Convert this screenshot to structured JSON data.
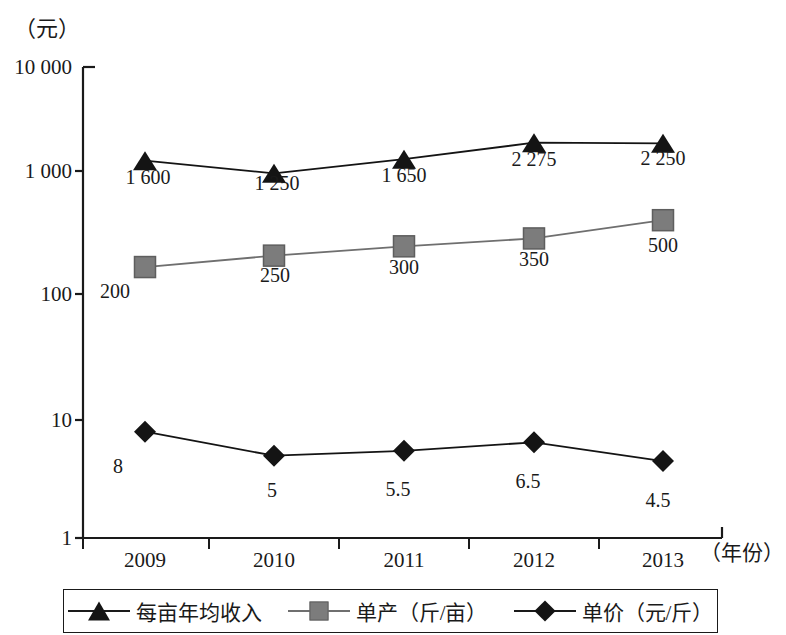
{
  "chart_data": {
    "type": "line",
    "title": "",
    "xlabel": "（年份）",
    "ylabel": "（元）",
    "yscale": "log",
    "ylim": [
      1,
      10000
    ],
    "grid": false,
    "legend_position": "bottom",
    "categories": [
      "2009",
      "2010",
      "2011",
      "2012",
      "2013"
    ],
    "y_ticks": [
      "10 000",
      "1 000",
      "100",
      "10",
      "1"
    ],
    "y_tick_values": [
      10000,
      1000,
      100,
      10,
      1
    ],
    "series": [
      {
        "name": "每亩年均收入",
        "marker": "triangle",
        "color": "#141414",
        "values": [
          1600,
          1250,
          1650,
          2275,
          2250
        ],
        "labels": [
          "1 600",
          "1 250",
          "1 650",
          "2 275",
          "2 250"
        ]
      },
      {
        "name": "单产（斤/亩）",
        "marker": "square",
        "color": "#7c7c7c",
        "values": [
          200,
          250,
          300,
          350,
          500
        ],
        "labels": [
          "200",
          "250",
          "300",
          "350",
          "500"
        ]
      },
      {
        "name": "单价（元/斤）",
        "marker": "diamond",
        "color": "#141414",
        "values": [
          8,
          5,
          5.5,
          6.5,
          4.5
        ],
        "labels": [
          "8",
          "5",
          "5.5",
          "6.5",
          "4.5"
        ]
      }
    ]
  },
  "axes": {
    "y_unit": "（元）",
    "x_unit": "（年份）",
    "y_ticks": [
      {
        "label": "10 000"
      },
      {
        "label": "1 000"
      },
      {
        "label": "100"
      },
      {
        "label": "10"
      },
      {
        "label": "1"
      }
    ],
    "x_ticks": [
      {
        "label": "2009"
      },
      {
        "label": "2010"
      },
      {
        "label": "2011"
      },
      {
        "label": "2012"
      },
      {
        "label": "2013"
      }
    ]
  },
  "labels": {
    "s0": [
      "1 600",
      "1 250",
      "1 650",
      "2 275",
      "2 250"
    ],
    "s1": [
      "200",
      "250",
      "300",
      "350",
      "500"
    ],
    "s2": [
      "8",
      "5",
      "5.5",
      "6.5",
      "4.5"
    ]
  },
  "legend": {
    "items": [
      {
        "label": "每亩年均收入",
        "marker": "triangle"
      },
      {
        "label": "单产（斤/亩）",
        "marker": "square"
      },
      {
        "label": "单价（元/斤）",
        "marker": "diamond"
      }
    ]
  },
  "colors": {
    "line_dark": "#141414",
    "line_gray": "#6f6f6f",
    "marker_gray": "#7c7c7c",
    "axis": "#1a1a1a"
  }
}
